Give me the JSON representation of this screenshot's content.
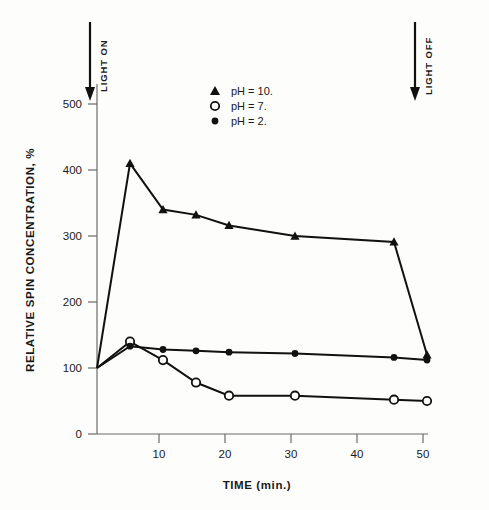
{
  "chart_data": {
    "type": "line",
    "title": "",
    "xlabel": "TIME  (min.)",
    "ylabel": "RELATIVE SPIN CONCENTRATION, %",
    "xlim": [
      0,
      52
    ],
    "ylim": [
      0,
      540
    ],
    "xticks": [
      10,
      20,
      30,
      40,
      50
    ],
    "xtick_labels": [
      "10",
      "20",
      "30",
      "40",
      "50"
    ],
    "yticks": [
      0,
      100,
      200,
      300,
      400,
      500
    ],
    "ytick_labels": [
      "0",
      "100",
      "200",
      "300",
      "400",
      "500"
    ],
    "grid": false,
    "legend_position": "upper-center",
    "series": [
      {
        "name": "pH = 10.",
        "marker": "filled-triangle",
        "x": [
          0,
          5,
          10,
          15,
          20,
          30,
          45,
          50
        ],
        "values": [
          100,
          410,
          340,
          332,
          316,
          300,
          291,
          120
        ]
      },
      {
        "name": "pH = 7.",
        "marker": "open-circle",
        "x": [
          0,
          5,
          10,
          15,
          20,
          30,
          45,
          50
        ],
        "values": [
          100,
          140,
          112,
          78,
          58,
          58,
          52,
          50
        ]
      },
      {
        "name": "pH = 2.",
        "marker": "filled-circle",
        "x": [
          0,
          5,
          10,
          15,
          20,
          30,
          45,
          50
        ],
        "values": [
          100,
          133,
          128,
          126,
          124,
          122,
          116,
          112
        ]
      }
    ],
    "annotations": [
      {
        "label": "LIGHT ON",
        "x": 0,
        "type": "down-arrow"
      },
      {
        "label": "LIGHT OFF",
        "x": 47.5,
        "type": "down-arrow"
      }
    ]
  },
  "legend": {
    "items": [
      {
        "label": "pH = 10.",
        "marker": "filled-triangle"
      },
      {
        "label": "pH = 7.",
        "marker": "open-circle"
      },
      {
        "label": "pH = 2.",
        "marker": "filled-circle"
      }
    ]
  },
  "axes": {
    "x_title": "TIME  (min.)",
    "y_title": "RELATIVE SPIN CONCENTRATION, %"
  },
  "annotations": {
    "light_on": "LIGHT ON",
    "light_off": "LIGHT OFF"
  },
  "colors": {
    "ink": "#111111",
    "axis": "#6b6b6b",
    "background": "#fdfdfb"
  }
}
